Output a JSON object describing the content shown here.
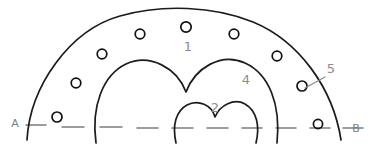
{
  "figure": {
    "background_color": "#ffffff",
    "ink_color": "#1c1c1c",
    "pencil_color": "#8d8d8d",
    "dash_color": "#7c7c7c",
    "width": 386,
    "height": 155
  },
  "labels": {
    "point_a": "A",
    "point_b": "B",
    "region_1": "1",
    "region_2": "2",
    "region_4": "4",
    "callout_5": "5"
  },
  "region_labels": [
    {
      "text": "1",
      "x": 188,
      "y": 51
    },
    {
      "text": "4",
      "x": 246,
      "y": 84
    },
    {
      "text": "2",
      "x": 215,
      "y": 112
    },
    {
      "text": "5",
      "x": 331,
      "y": 73
    }
  ],
  "endpoint_labels": [
    {
      "text": "A",
      "x": 15,
      "y": 127
    },
    {
      "text": "B",
      "x": 356,
      "y": 132
    }
  ],
  "circles": [
    {
      "index": 1,
      "cx": 57,
      "cy": 117,
      "r": 5.0
    },
    {
      "index": 2,
      "cx": 76,
      "cy": 83,
      "r": 4.8
    },
    {
      "index": 3,
      "cx": 102,
      "cy": 54,
      "r": 4.8
    },
    {
      "index": 4,
      "cx": 140,
      "cy": 34,
      "r": 4.8
    },
    {
      "index": 5,
      "cx": 186,
      "cy": 27,
      "r": 5.2
    },
    {
      "index": 6,
      "cx": 234,
      "cy": 34,
      "r": 4.8
    },
    {
      "index": 7,
      "cx": 277,
      "cy": 56,
      "r": 4.8
    },
    {
      "index": 8,
      "cx": 302,
      "cy": 86,
      "r": 5.0
    },
    {
      "index": 9,
      "cx": 318,
      "cy": 124,
      "r": 4.6
    }
  ],
  "baseline_dashes": [
    {
      "x1": 26,
      "y1": 125,
      "x2": 46,
      "y2": 125
    },
    {
      "x1": 62,
      "y1": 127,
      "x2": 84,
      "y2": 127
    },
    {
      "x1": 100,
      "y1": 127,
      "x2": 122,
      "y2": 127
    },
    {
      "x1": 137,
      "y1": 128,
      "x2": 158,
      "y2": 128
    },
    {
      "x1": 172,
      "y1": 128,
      "x2": 193,
      "y2": 128
    },
    {
      "x1": 207,
      "y1": 128,
      "x2": 228,
      "y2": 128
    },
    {
      "x1": 242,
      "y1": 128,
      "x2": 262,
      "y2": 128
    },
    {
      "x1": 276,
      "y1": 128,
      "x2": 296,
      "y2": 128
    },
    {
      "x1": 310,
      "y1": 128,
      "x2": 330,
      "y2": 128
    },
    {
      "x1": 343,
      "y1": 128,
      "x2": 363,
      "y2": 128
    }
  ],
  "curves": {
    "outer_arc": "M 27 140 C 30 86 70 30 120 16 C 162 4 214 6 253 22 C 299 41 333 88 341 140",
    "outer_heart": "M 96 143 C 91 106 103 75 126 64 C 150 53 177 68 186 92 C 195 68 221 52 245 63 C 269 74 281 104 277 143",
    "inner_heart": "M 176 143 C 172 125 176 111 187 105 C 198 99 212 105 215 117 C 220 105 234 98 245 104 C 257 111 260 126 256 143",
    "callout_leader": "M 325 77 L 305 88"
  },
  "counts": {
    "circles": 9,
    "baseline_dashes": 10,
    "curves": 3
  }
}
